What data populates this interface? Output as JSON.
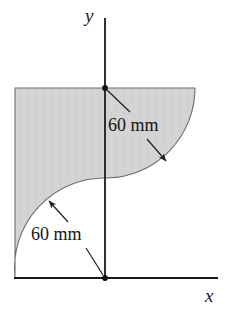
{
  "figure": {
    "axes": {
      "x_label": "x",
      "y_label": "y",
      "x_axis": {
        "x1": 14,
        "y1": 278,
        "x2": 218,
        "y2": 278
      },
      "y_axis": {
        "x1": 105,
        "y1": 18,
        "x2": 105,
        "y2": 278
      },
      "origin_point": {
        "x": 105,
        "y": 278
      },
      "upper_point": {
        "x": 105,
        "y": 88
      }
    },
    "dimensions": [
      {
        "id": "upper-radius",
        "text": "60 mm",
        "value": 60,
        "unit": "mm",
        "label_x": 108,
        "label_y": 116,
        "leaders": [
          {
            "from_x": 130,
            "from_y": 112,
            "to_x": 106,
            "to_y": 89,
            "arrow": false
          },
          {
            "from_x": 147,
            "from_y": 139,
            "to_x": 167,
            "to_y": 162,
            "arrow": true
          }
        ]
      },
      {
        "id": "lower-radius",
        "text": "60 mm",
        "value": 60,
        "unit": "mm",
        "label_x": 31,
        "label_y": 225,
        "leaders": [
          {
            "from_x": 68,
            "from_y": 222,
            "to_x": 48,
            "to_y": 200,
            "arrow": true
          },
          {
            "from_x": 86,
            "from_y": 248,
            "to_x": 104,
            "to_y": 276,
            "arrow": false
          }
        ]
      }
    ],
    "shape": {
      "fill_color": "#d6d4d2",
      "stroke_color": "#6e6c6a",
      "left_edge_x": 15,
      "top_edge_y": 88,
      "top_edge_x_end": 195,
      "bottom_tip": {
        "x": 15,
        "y": 276
      },
      "upper_arc": {
        "center_x": 105,
        "center_y": 88,
        "radius": 90,
        "start_x": 195,
        "start_y": 88,
        "end_x": 110,
        "end_y": 178
      },
      "lower_arc": {
        "center_x": 105,
        "center_y": 278,
        "radius": 90,
        "start_x": 105,
        "start_y": 188,
        "end_x": 15,
        "end_y": 277
      }
    },
    "colors": {
      "ink": "#1a1a1a",
      "shade": "#d6d4d2",
      "outline": "#6e6c6a",
      "background": "#ffffff"
    }
  }
}
